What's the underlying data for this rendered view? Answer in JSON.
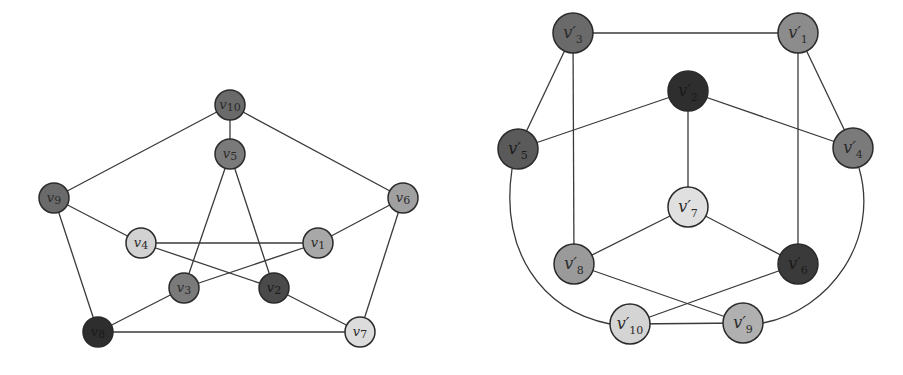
{
  "colors": {
    "dark": "#3a3a3a",
    "mid_dark": "#6b6b6b",
    "mid": "#8c8c8c",
    "light_mid": "#a8a8a8",
    "light": "#d6d6d6",
    "edge": "#3a3a3a"
  },
  "left_graph": {
    "radius": 15,
    "nodes": [
      {
        "id": "v1",
        "label": "v",
        "sub": "1",
        "x": 318,
        "y": 243,
        "fill": "#a8a8a8"
      },
      {
        "id": "v2",
        "label": "v",
        "sub": "2",
        "x": 274,
        "y": 288,
        "fill": "#4a4a4a"
      },
      {
        "id": "v3",
        "label": "v",
        "sub": "3",
        "x": 184,
        "y": 288,
        "fill": "#7a7a7a"
      },
      {
        "id": "v4",
        "label": "v",
        "sub": "4",
        "x": 141,
        "y": 243,
        "fill": "#d2d2d2"
      },
      {
        "id": "v5",
        "label": "v",
        "sub": "5",
        "x": 230,
        "y": 154,
        "fill": "#7a7a7a"
      },
      {
        "id": "v6",
        "label": "v",
        "sub": "6",
        "x": 403,
        "y": 198,
        "fill": "#a0a0a0"
      },
      {
        "id": "v7",
        "label": "v",
        "sub": "7",
        "x": 360,
        "y": 332,
        "fill": "#dcdcdc"
      },
      {
        "id": "v8",
        "label": "v",
        "sub": "8",
        "x": 98,
        "y": 332,
        "fill": "#2e2e2e"
      },
      {
        "id": "v9",
        "label": "v",
        "sub": "9",
        "x": 54,
        "y": 198,
        "fill": "#6a6a6a"
      },
      {
        "id": "v10",
        "label": "v",
        "sub": "10",
        "x": 230,
        "y": 105,
        "fill": "#6a6a6a"
      }
    ],
    "edges": [
      [
        "v10",
        "v5"
      ],
      [
        "v10",
        "v9"
      ],
      [
        "v10",
        "v6"
      ],
      [
        "v9",
        "v4"
      ],
      [
        "v9",
        "v8"
      ],
      [
        "v6",
        "v1"
      ],
      [
        "v6",
        "v7"
      ],
      [
        "v8",
        "v7"
      ],
      [
        "v8",
        "v3"
      ],
      [
        "v7",
        "v2"
      ],
      [
        "v5",
        "v3"
      ],
      [
        "v5",
        "v2"
      ],
      [
        "v4",
        "v1"
      ],
      [
        "v4",
        "v2"
      ],
      [
        "v1",
        "v3"
      ]
    ]
  },
  "right_graph": {
    "radius": 20,
    "nodes": [
      {
        "id": "v1p",
        "label": "v′",
        "sub": "1",
        "x": 798,
        "y": 33,
        "fill": "#8c8c8c"
      },
      {
        "id": "v2p",
        "label": "v′",
        "sub": "2",
        "x": 688,
        "y": 91,
        "fill": "#2e2e2e"
      },
      {
        "id": "v3p",
        "label": "v′",
        "sub": "3",
        "x": 573,
        "y": 33,
        "fill": "#6a6a6a"
      },
      {
        "id": "v4p",
        "label": "v′",
        "sub": "4",
        "x": 853,
        "y": 148,
        "fill": "#7a7a7a"
      },
      {
        "id": "v5p",
        "label": "v′",
        "sub": "5",
        "x": 518,
        "y": 149,
        "fill": "#5a5a5a"
      },
      {
        "id": "v6p",
        "label": "v′",
        "sub": "6",
        "x": 798,
        "y": 264,
        "fill": "#3a3a3a"
      },
      {
        "id": "v7p",
        "label": "v′",
        "sub": "7",
        "x": 688,
        "y": 207,
        "fill": "#e0e0e0"
      },
      {
        "id": "v8p",
        "label": "v′",
        "sub": "8",
        "x": 574,
        "y": 264,
        "fill": "#9a9a9a"
      },
      {
        "id": "v9p",
        "label": "v′",
        "sub": "9",
        "x": 743,
        "y": 323,
        "fill": "#b0b0b0"
      },
      {
        "id": "v10p",
        "label": "v′",
        "sub": "10",
        "x": 630,
        "y": 324,
        "fill": "#d4d4d4"
      }
    ],
    "edges": [
      [
        "v3p",
        "v1p"
      ],
      [
        "v3p",
        "v5p"
      ],
      [
        "v3p",
        "v8p"
      ],
      [
        "v1p",
        "v4p"
      ],
      [
        "v1p",
        "v6p"
      ],
      [
        "v2p",
        "v5p"
      ],
      [
        "v2p",
        "v4p"
      ],
      [
        "v2p",
        "v7p"
      ],
      [
        "v7p",
        "v8p"
      ],
      [
        "v7p",
        "v6p"
      ],
      [
        "v8p",
        "v9p"
      ],
      [
        "v6p",
        "v10p"
      ],
      [
        "v10p",
        "v9p"
      ]
    ],
    "curved_edges": [
      {
        "from": "v5p",
        "to": "v10p",
        "path": "M 512 169 C 500 250, 540 310, 610 324"
      },
      {
        "from": "v4p",
        "to": "v9p",
        "path": "M 859 168 C 880 240, 830 310, 763 323"
      }
    ]
  }
}
